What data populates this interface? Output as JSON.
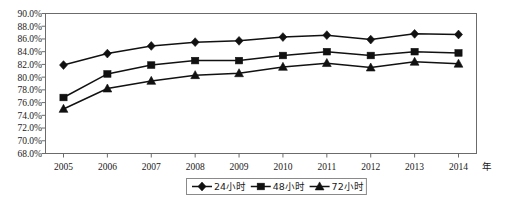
{
  "chart_data": {
    "type": "line",
    "title": "",
    "xlabel": "年",
    "ylabel": "",
    "grid": false,
    "legend_position": "bottom",
    "categories": [
      "2005",
      "2006",
      "2007",
      "2008",
      "2009",
      "2010",
      "2011",
      "2012",
      "2013",
      "2014"
    ],
    "xlim": [
      2005,
      2014
    ],
    "ylim": [
      68.0,
      90.0
    ],
    "ytick_step": 2.0,
    "yticks": [
      "90.0%",
      "88.0%",
      "86.0%",
      "84.0%",
      "82.0%",
      "80.0%",
      "78.0%",
      "76.0%",
      "74.0%",
      "72.0%",
      "70.0%",
      "68.0%"
    ],
    "ytick_values": [
      90.0,
      88.0,
      86.0,
      84.0,
      82.0,
      80.0,
      78.0,
      76.0,
      74.0,
      72.0,
      70.0,
      68.0
    ],
    "series": [
      {
        "name": "24小时",
        "marker": "diamond",
        "values": [
          81.9,
          83.7,
          84.9,
          85.5,
          85.7,
          86.3,
          86.6,
          85.9,
          86.8,
          86.7
        ]
      },
      {
        "name": "48小时",
        "marker": "square",
        "values": [
          76.8,
          80.5,
          81.9,
          82.6,
          82.6,
          83.4,
          84.0,
          83.4,
          84.0,
          83.8
        ]
      },
      {
        "name": "72小时",
        "marker": "triangle",
        "values": [
          75.0,
          78.2,
          79.4,
          80.3,
          80.6,
          81.6,
          82.2,
          81.5,
          82.4,
          82.1
        ]
      }
    ]
  },
  "axes": {
    "x_unit_label": "年"
  },
  "legend": {
    "entries": [
      {
        "label": "24小时",
        "marker": "diamond"
      },
      {
        "label": "48小时",
        "marker": "square"
      },
      {
        "label": "72小时",
        "marker": "triangle"
      }
    ]
  },
  "colors": {
    "series_stroke": "#111111",
    "frame_stroke": "#6b6b6b",
    "text": "#1a1a1a",
    "background": "#ffffff"
  }
}
